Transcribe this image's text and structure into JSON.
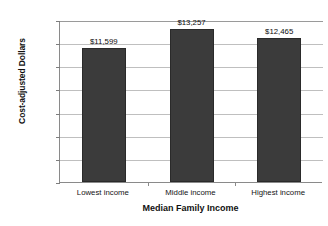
{
  "chart_data": {
    "type": "bar",
    "title": "",
    "xlabel": "Median Family Income",
    "ylabel": "Cost-adjusted Dollars",
    "categories": [
      "Lowest income",
      "Middle income",
      "Highest income"
    ],
    "values": [
      11599,
      13257,
      12465
    ],
    "value_labels": [
      "$11,599",
      "$13,257",
      "$12,465"
    ],
    "ylim": [
      0,
      14000
    ],
    "ytick_values": [
      0,
      2000,
      4000,
      6000,
      8000,
      10000,
      12000,
      14000
    ],
    "ytick_labels": [
      "0",
      "2,000",
      "4,000",
      "6,000",
      "8,000",
      "10,000",
      "12,000",
      "14,000"
    ],
    "grid": true,
    "legend": false,
    "bar_color": "#3b3b3b",
    "axis_color": "#8a8a8a",
    "grid_color": "#bfbfbf",
    "background": "#ffffff"
  }
}
